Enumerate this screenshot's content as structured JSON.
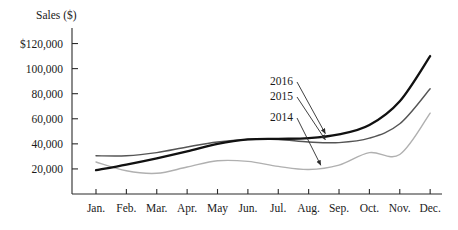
{
  "chart_data": {
    "type": "line",
    "title": "",
    "xlabel": "",
    "ylabel": "Sales ($)",
    "ylim": [
      0,
      130000
    ],
    "xlim": [
      0,
      11
    ],
    "grid": false,
    "legend_position": "inline-annotations",
    "categories": [
      "Jan.",
      "Feb.",
      "Mar.",
      "Apr.",
      "May",
      "Jun.",
      "Jul.",
      "Aug.",
      "Sep.",
      "Oct.",
      "Nov.",
      "Dec."
    ],
    "ytick_labels": [
      "$120,000",
      "100,000",
      "80,000",
      "60,000",
      "40,000",
      "20,000"
    ],
    "ytick_values": [
      120000,
      100000,
      80000,
      60000,
      40000,
      20000
    ],
    "series": [
      {
        "name": "2016",
        "color": "#111111",
        "width": 2.3,
        "values": [
          19000,
          23500,
          28500,
          34000,
          40000,
          43500,
          44000,
          44500,
          47500,
          55000,
          74000,
          110000
        ]
      },
      {
        "name": "2015",
        "color": "#555555",
        "width": 1.4,
        "values": [
          30500,
          30500,
          33000,
          37500,
          41500,
          43500,
          43500,
          41500,
          41000,
          44500,
          56000,
          84000
        ]
      },
      {
        "name": "2014",
        "color": "#b0b0b0",
        "width": 1.4,
        "values": [
          25500,
          18500,
          16500,
          21500,
          26500,
          26000,
          22000,
          19500,
          23000,
          33000,
          31500,
          64500
        ]
      }
    ],
    "annotations": [
      {
        "label": "2016",
        "target_series": "2016",
        "target_month": "Aug."
      },
      {
        "label": "2015",
        "target_series": "2015",
        "target_month": "Aug."
      },
      {
        "label": "2014",
        "target_series": "2014",
        "target_month": "Aug."
      }
    ]
  }
}
